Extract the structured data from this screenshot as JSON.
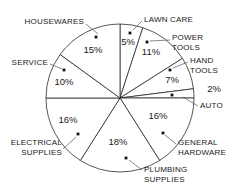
{
  "chart_data": {
    "type": "pie",
    "title": "",
    "xlabel": "",
    "ylabel": "",
    "legend_position": "outside-labels",
    "grid": false,
    "start_angle_deg": 0,
    "direction": "clockwise",
    "value_unit": "%",
    "categories": [
      "LAWN CARE",
      "POWER TOOLS",
      "HAND TOOLS",
      "AUTO",
      "GENERAL HARDWARE",
      "PLUMBING SUPPLIES",
      "ELECTRICAL SUPPLIES",
      "SERVICE",
      "HOUSEWARES"
    ],
    "values": [
      5,
      11,
      7,
      2,
      16,
      18,
      16,
      10,
      15
    ],
    "total": 100,
    "slices": [
      {
        "label": "LAWN CARE",
        "value": 5,
        "value_label": "5%",
        "label_lines": [
          "LAWN CARE"
        ],
        "pct_x": 128,
        "pct_y": 42,
        "text_x": 144,
        "text_y": 22,
        "text_anchor": "start",
        "dot_x": 130,
        "dot_y": 33,
        "leader": "M 142 21 L 133 30"
      },
      {
        "label": "POWER TOOLS",
        "value": 11,
        "value_label": "11%",
        "label_lines": [
          "POWER",
          "TOOLS"
        ],
        "pct_x": 151,
        "pct_y": 52,
        "text_x": 172,
        "text_y": 40,
        "text_anchor": "start",
        "dot_x": 147,
        "dot_y": 42,
        "leader": "M 170 40 L 150 41"
      },
      {
        "label": "HAND TOOLS",
        "value": 7,
        "value_label": "7%",
        "label_lines": [
          "HAND",
          "TOOLS"
        ],
        "pct_x": 172,
        "pct_y": 80,
        "text_x": 190,
        "text_y": 63,
        "text_anchor": "start",
        "dot_x": 170,
        "dot_y": 70,
        "leader": "M 188 62 L 173 68"
      },
      {
        "label": "AUTO",
        "value": 2,
        "value_label": "2%",
        "label_lines": [
          "AUTO"
        ],
        "pct_x": 214,
        "pct_y": 89,
        "text_x": 200,
        "text_y": 108,
        "text_anchor": "start",
        "dot_x": 172,
        "dot_y": 95,
        "leader": "M 198 106 L 183 97"
      },
      {
        "label": "GENERAL HARDWARE",
        "value": 16,
        "value_label": "16%",
        "label_lines": [
          "GENERAL",
          "HARDWARE"
        ],
        "pct_x": 158,
        "pct_y": 116,
        "text_x": 178,
        "text_y": 145,
        "text_anchor": "start",
        "dot_x": 163,
        "dot_y": 133,
        "leader": "M 176 144 L 165 135"
      },
      {
        "label": "PLUMBING SUPPLIES",
        "value": 18,
        "value_label": "18%",
        "label_lines": [
          "PLUMBING",
          "SUPPLIES"
        ],
        "pct_x": 118,
        "pct_y": 142,
        "text_x": 144,
        "text_y": 172,
        "text_anchor": "start",
        "dot_x": 126,
        "dot_y": 158,
        "leader": "M 142 170 L 129 160"
      },
      {
        "label": "ELECTRICAL SUPPLIES",
        "value": 16,
        "value_label": "16%",
        "label_lines": [
          "ELECTRICAL",
          "SUPPLIES"
        ],
        "pct_x": 68,
        "pct_y": 120,
        "text_x": 62,
        "text_y": 145,
        "text_anchor": "end",
        "dot_x": 78,
        "dot_y": 134,
        "leader": "M 63 149 L 76 137"
      },
      {
        "label": "SERVICE",
        "value": 10,
        "value_label": "10%",
        "label_lines": [
          "SERVICE"
        ],
        "pct_x": 64,
        "pct_y": 82,
        "text_x": 48,
        "text_y": 65,
        "text_anchor": "end",
        "dot_x": 64,
        "dot_y": 70,
        "leader": "M 50 64 L 62 69"
      },
      {
        "label": "HOUSEWARES",
        "value": 15,
        "value_label": "15%",
        "label_lines": [
          "HOUSEWARES"
        ],
        "pct_x": 93,
        "pct_y": 50,
        "text_x": 84,
        "text_y": 24,
        "text_anchor": "end",
        "dot_x": 96,
        "dot_y": 37,
        "leader": "M 86 24 L 98 34"
      }
    ],
    "geometry": {
      "center_x": 120,
      "center_y": 98,
      "radius": 74
    },
    "colors": {
      "slice_fill": "#ffffff",
      "slice_stroke": "#2b2b2b",
      "text": "#1a1a1a",
      "leader": "#555555",
      "background": "#ffffff"
    }
  }
}
